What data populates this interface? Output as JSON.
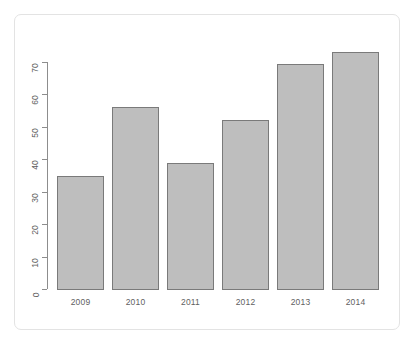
{
  "figure": {
    "background_color": "#ffffff",
    "frame_color": "#e3e3e3",
    "bar_fill_color": "#bebebe",
    "bar_border_color": "#7a7a7a",
    "axis_color": "#8d8d8d",
    "tick_label_color": "#5f5f5f"
  },
  "chart_data": {
    "type": "bar",
    "title": "",
    "subtitle": "",
    "xlabel": "",
    "ylabel": "",
    "categories": [
      "2009",
      "2010",
      "2011",
      "2012",
      "2013",
      "2014"
    ],
    "values": [
      35,
      56,
      39,
      52,
      69.5,
      73
    ],
    "ylim": [
      0,
      75
    ],
    "yticks": [
      0,
      10,
      20,
      30,
      40,
      50,
      60,
      70
    ],
    "ytick_labels": [
      "0",
      "10",
      "20",
      "30",
      "40",
      "50",
      "60",
      "70"
    ],
    "grid": false,
    "legend": null,
    "legend_position": "none",
    "ytick_label_rotation": -90,
    "annotations": []
  },
  "geometry": {
    "baseline_y": 289,
    "y_at_70": 62,
    "bar_left_x": [
      57,
      112,
      167,
      222,
      277,
      332
    ],
    "bar_width": 47,
    "tick_x_left": 42,
    "axis_x": 47
  }
}
